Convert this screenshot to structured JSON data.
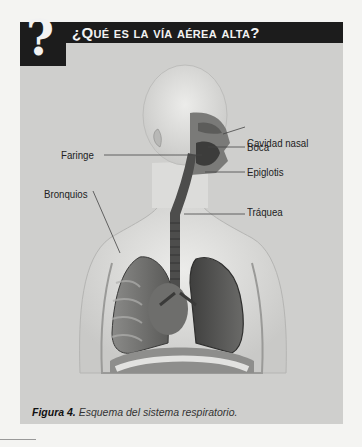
{
  "header": {
    "icon": "question-mark-icon",
    "icon_glyph": "?",
    "title": "¿Qué es la vía aérea alta?"
  },
  "figure": {
    "labels": [
      {
        "id": "cavidad-nasal",
        "text": "Cavidad nasal"
      },
      {
        "id": "boca",
        "text": "Boca"
      },
      {
        "id": "faringe",
        "text": "Faringe"
      },
      {
        "id": "epiglotis",
        "text": "Epiglotis"
      },
      {
        "id": "bronquios",
        "text": "Bronquios"
      },
      {
        "id": "traquea",
        "text": "Tráquea"
      }
    ]
  },
  "caption": {
    "prefix": "Figura 4.",
    "text": " Esquema del sistema respiratorio."
  },
  "colors": {
    "header_bg": "#1c1c1c",
    "panel_bg": "#cfcfcd",
    "page_bg": "#f4f4f2"
  }
}
